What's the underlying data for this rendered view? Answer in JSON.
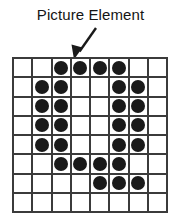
{
  "figure": {
    "caption": "Picture Element",
    "annotation_icon": "arrow-down-left-icon"
  },
  "colors": {
    "dot": "#1a1a1a",
    "gridline": "#3b3b3b",
    "cell_background": "#ffffff",
    "text": "#141414",
    "page_background": "#ffffff"
  },
  "chart_data": {
    "type": "heatmap",
    "title": "Picture Element",
    "xlabel": "",
    "ylabel": "",
    "columns": 8,
    "rows": 8,
    "legend": [
      {
        "label": "Picture Element",
        "value": 1,
        "color": "#1a1a1a"
      },
      {
        "label": "Empty",
        "value": 0,
        "color": "#ffffff"
      }
    ],
    "annotations": [
      {
        "text": "Picture Element",
        "points_to_cell": {
          "row": 1,
          "column": 4
        },
        "arrow": {
          "from_x": 96,
          "from_y": 28,
          "to_x": 75,
          "to_y": 58
        }
      }
    ],
    "values": [
      [
        0,
        0,
        1,
        1,
        1,
        1,
        0,
        0
      ],
      [
        0,
        1,
        1,
        0,
        0,
        1,
        1,
        0
      ],
      [
        0,
        1,
        1,
        0,
        0,
        1,
        1,
        0
      ],
      [
        0,
        1,
        1,
        0,
        0,
        1,
        1,
        0
      ],
      [
        0,
        1,
        1,
        0,
        0,
        1,
        1,
        0
      ],
      [
        0,
        0,
        1,
        1,
        1,
        1,
        0,
        0
      ],
      [
        0,
        0,
        0,
        0,
        1,
        1,
        1,
        0
      ],
      [
        0,
        0,
        0,
        0,
        0,
        0,
        0,
        0
      ]
    ]
  }
}
